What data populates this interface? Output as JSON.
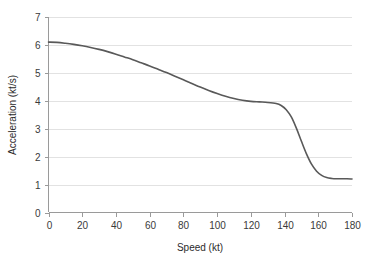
{
  "chart_data": {
    "type": "line",
    "title": "",
    "xlabel": "Speed (kt)",
    "ylabel": "Acceleration (kt/s)",
    "xlim": [
      0,
      180
    ],
    "ylim": [
      0,
      7
    ],
    "xticks": [
      0,
      20,
      40,
      60,
      80,
      100,
      120,
      140,
      160,
      180
    ],
    "xtick_labels": [
      "0",
      "20",
      "40",
      "60",
      "80",
      "100",
      "120",
      "140",
      "160",
      "180"
    ],
    "yticks": [
      0,
      1,
      2,
      3,
      4,
      5,
      6,
      7
    ],
    "ytick_labels": [
      "0",
      "1",
      "2",
      "3",
      "4",
      "5",
      "6",
      "7"
    ],
    "grid": "horizontal",
    "legend": "none",
    "line_color": "#595959",
    "background_color": "#ffffff",
    "gridline_color": "#e2e2e2",
    "series": [
      {
        "name": "Acceleration",
        "x": [
          0,
          5,
          10,
          15,
          20,
          25,
          30,
          35,
          40,
          45,
          50,
          55,
          60,
          65,
          70,
          75,
          80,
          85,
          90,
          95,
          100,
          105,
          110,
          115,
          120,
          125,
          130,
          135,
          138,
          141,
          144,
          147,
          150,
          153,
          156,
          159,
          162,
          165,
          168,
          171,
          174,
          177,
          180
        ],
        "y": [
          6.1,
          6.09,
          6.06,
          6.02,
          5.97,
          5.91,
          5.84,
          5.76,
          5.67,
          5.57,
          5.47,
          5.36,
          5.25,
          5.13,
          5.01,
          4.88,
          4.75,
          4.62,
          4.49,
          4.37,
          4.26,
          4.16,
          4.08,
          4.02,
          3.98,
          3.96,
          3.94,
          3.9,
          3.83,
          3.68,
          3.42,
          3.02,
          2.55,
          2.1,
          1.73,
          1.48,
          1.33,
          1.25,
          1.22,
          1.21,
          1.21,
          1.21,
          1.2
        ]
      }
    ]
  }
}
